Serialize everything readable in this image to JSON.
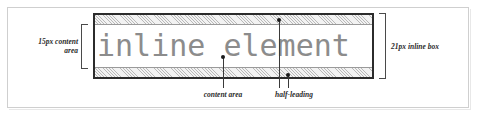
{
  "figure": {
    "inline_text": "inline element",
    "labels": {
      "content_size": "15px content\narea",
      "inline_box_size": "21px inline box",
      "content_area": "content area",
      "half_leading": "half-leading"
    },
    "colors": {
      "inline_text": "#8c8c8c",
      "box_border": "#2b2b2b",
      "leading_band": "#f2f2f2",
      "hatch_line": "#b9b9b9",
      "label_text": "#2b2b2b",
      "leader_line": "#3a3a3a",
      "frame_border": "#cfcfcf"
    }
  }
}
